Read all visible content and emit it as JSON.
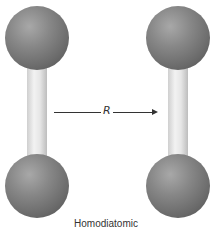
{
  "figure": {
    "type": "molecular-diagram",
    "caption": "Homodiatomic",
    "distance_label": "R",
    "molecules": [
      {
        "name": "left-molecule",
        "atoms": 2,
        "bond": "single-stick"
      },
      {
        "name": "right-molecule",
        "atoms": 2,
        "bond": "single-stick"
      }
    ],
    "colors": {
      "atom": "#7a7a7a",
      "bond": "#e8e8e8",
      "arrow": "#333333"
    }
  }
}
